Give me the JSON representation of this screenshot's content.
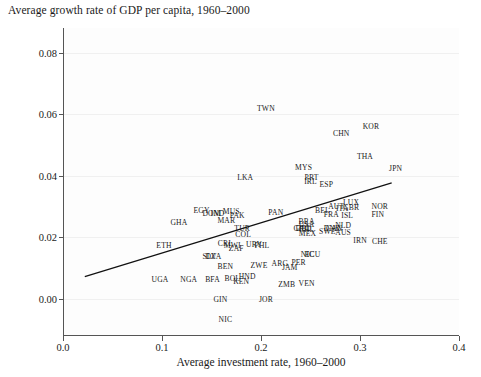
{
  "chart_data": {
    "type": "scatter",
    "title": "Average growth rate of GDP per capita, 1960–2000",
    "xlabel": "Average investment rate, 1960–2000",
    "ylabel": "",
    "xlim": [
      0.0,
      0.4
    ],
    "ylim": [
      -0.012,
      0.088
    ],
    "xticks": [
      "0.0",
      "0.1",
      "0.2",
      "0.3",
      "0.4"
    ],
    "xtick_values": [
      0.0,
      0.1,
      0.2,
      0.3,
      0.4
    ],
    "yticks": [
      "0.00",
      "0.02",
      "0.04",
      "0.06",
      "0.08"
    ],
    "ytick_values": [
      0.0,
      0.02,
      0.04,
      0.06,
      0.08
    ],
    "grid": true,
    "legend": "none",
    "marker_style": "text-label",
    "trendline": {
      "type": "linear-fit",
      "x_start": 0.022,
      "y_start": 0.0073,
      "x_end": 0.332,
      "y_end": 0.0377,
      "color": "#111111"
    },
    "points": [
      {
        "label": "TWN",
        "x": 0.205,
        "y": 0.062
      },
      {
        "label": "CHN",
        "x": 0.281,
        "y": 0.0538
      },
      {
        "label": "KOR",
        "x": 0.311,
        "y": 0.0563
      },
      {
        "label": "THA",
        "x": 0.305,
        "y": 0.0466
      },
      {
        "label": "JPN",
        "x": 0.336,
        "y": 0.0427
      },
      {
        "label": "MYS",
        "x": 0.243,
        "y": 0.043
      },
      {
        "label": "LKA",
        "x": 0.184,
        "y": 0.0396
      },
      {
        "label": "PRT",
        "x": 0.251,
        "y": 0.0396
      },
      {
        "label": "IRL",
        "x": 0.25,
        "y": 0.0384
      },
      {
        "label": "ESP",
        "x": 0.266,
        "y": 0.0375
      },
      {
        "label": "LUX",
        "x": 0.291,
        "y": 0.0316
      },
      {
        "label": "AUT",
        "x": 0.276,
        "y": 0.0303
      },
      {
        "label": "ITA",
        "x": 0.282,
        "y": 0.0297
      },
      {
        "label": "GBR",
        "x": 0.291,
        "y": 0.0298
      },
      {
        "label": "NOR",
        "x": 0.32,
        "y": 0.0301
      },
      {
        "label": "FIN",
        "x": 0.318,
        "y": 0.0276
      },
      {
        "label": "ISL",
        "x": 0.287,
        "y": 0.0272
      },
      {
        "label": "FRA",
        "x": 0.271,
        "y": 0.0277
      },
      {
        "label": "BEL",
        "x": 0.262,
        "y": 0.0288
      },
      {
        "label": "NLD",
        "x": 0.283,
        "y": 0.024
      },
      {
        "label": "DNK",
        "x": 0.272,
        "y": 0.023
      },
      {
        "label": "SWE",
        "x": 0.267,
        "y": 0.022
      },
      {
        "label": "AUS",
        "x": 0.283,
        "y": 0.0219
      },
      {
        "label": "CAN",
        "x": 0.274,
        "y": 0.0232
      },
      {
        "label": "USA",
        "x": 0.246,
        "y": 0.0243
      },
      {
        "label": "DEU",
        "x": 0.243,
        "y": 0.0232
      },
      {
        "label": "GRC",
        "x": 0.241,
        "y": 0.023
      },
      {
        "label": "BRA",
        "x": 0.246,
        "y": 0.0253
      },
      {
        "label": "CHL",
        "x": 0.246,
        "y": 0.0226
      },
      {
        "label": "MEX",
        "x": 0.247,
        "y": 0.0213
      },
      {
        "label": "IRN",
        "x": 0.3,
        "y": 0.0191
      },
      {
        "label": "CHE",
        "x": 0.32,
        "y": 0.019
      },
      {
        "label": "PAN",
        "x": 0.215,
        "y": 0.0283
      },
      {
        "label": "MUS",
        "x": 0.17,
        "y": 0.0285
      },
      {
        "label": "PAK",
        "x": 0.176,
        "y": 0.0272
      },
      {
        "label": "MAR",
        "x": 0.165,
        "y": 0.0257
      },
      {
        "label": "EGY",
        "x": 0.14,
        "y": 0.0288
      },
      {
        "label": "DOM",
        "x": 0.15,
        "y": 0.028
      },
      {
        "label": "IND",
        "x": 0.156,
        "y": 0.0279
      },
      {
        "label": "GHA",
        "x": 0.117,
        "y": 0.0251
      },
      {
        "label": "TUR",
        "x": 0.181,
        "y": 0.0232
      },
      {
        "label": "COL",
        "x": 0.182,
        "y": 0.0212
      },
      {
        "label": "CRI",
        "x": 0.163,
        "y": 0.0183
      },
      {
        "label": "MWI",
        "x": 0.171,
        "y": 0.0175
      },
      {
        "label": "ZAF",
        "x": 0.175,
        "y": 0.0165
      },
      {
        "label": "URY",
        "x": 0.193,
        "y": 0.0178
      },
      {
        "label": "PHL",
        "x": 0.201,
        "y": 0.0176
      },
      {
        "label": "ETH",
        "x": 0.102,
        "y": 0.0176
      },
      {
        "label": "SLV",
        "x": 0.148,
        "y": 0.014
      },
      {
        "label": "DZA",
        "x": 0.152,
        "y": 0.0139
      },
      {
        "label": "ECU",
        "x": 0.252,
        "y": 0.0146
      },
      {
        "label": "NIC",
        "x": 0.247,
        "y": 0.0147
      },
      {
        "label": "ARG",
        "x": 0.219,
        "y": 0.0118
      },
      {
        "label": "PER",
        "x": 0.238,
        "y": 0.0119
      },
      {
        "label": "JAM",
        "x": 0.229,
        "y": 0.0105
      },
      {
        "label": "ZWE",
        "x": 0.198,
        "y": 0.011
      },
      {
        "label": "BEN",
        "x": 0.164,
        "y": 0.0107
      },
      {
        "label": "HND",
        "x": 0.186,
        "y": 0.0075
      },
      {
        "label": "KEN",
        "x": 0.18,
        "y": 0.006
      },
      {
        "label": "BOL",
        "x": 0.171,
        "y": 0.0069
      },
      {
        "label": "BFA",
        "x": 0.151,
        "y": 0.0066
      },
      {
        "label": "NGA",
        "x": 0.127,
        "y": 0.0066
      },
      {
        "label": "UGA",
        "x": 0.098,
        "y": 0.0065
      },
      {
        "label": "ZMB",
        "x": 0.226,
        "y": 0.005
      },
      {
        "label": "VEN",
        "x": 0.246,
        "y": 0.0051
      },
      {
        "label": "GIN",
        "x": 0.159,
        "y": 0.0
      },
      {
        "label": "JOR",
        "x": 0.205,
        "y": 0.0
      },
      {
        "label": "NIC2",
        "x": 0.164,
        "y": -0.0064
      }
    ]
  },
  "axes": {
    "x_ticks": [
      {
        "label": "0.0",
        "value": 0.0
      },
      {
        "label": "0.1",
        "value": 0.1
      },
      {
        "label": "0.2",
        "value": 0.2
      },
      {
        "label": "0.3",
        "value": 0.3
      },
      {
        "label": "0.4",
        "value": 0.4
      }
    ],
    "y_ticks": [
      {
        "label": "0.00",
        "value": 0.0
      },
      {
        "label": "0.02",
        "value": 0.02
      },
      {
        "label": "0.04",
        "value": 0.04
      },
      {
        "label": "0.06",
        "value": 0.06
      },
      {
        "label": "0.08",
        "value": 0.08
      }
    ]
  },
  "colors": {
    "axis": "#555555",
    "grid": "#f0f0f0",
    "text": "#1a1a1a",
    "trendline": "#111111",
    "background": "#ffffff"
  }
}
